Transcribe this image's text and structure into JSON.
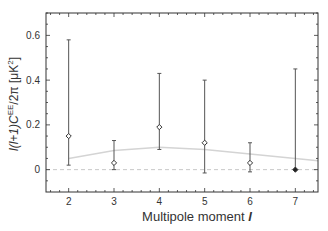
{
  "chart_data": {
    "type": "scatter",
    "title": "",
    "xlabel": "Multipole moment l",
    "ylabel": "l(l+1)C_l^EE/2π [μK²]",
    "xlim": [
      1.5,
      7.5
    ],
    "ylim": [
      -0.1,
      0.7
    ],
    "x_ticks": [
      2,
      3,
      4,
      5,
      6,
      7
    ],
    "y_ticks": [
      0,
      0.2,
      0.4,
      0.6
    ],
    "y_tick_labels": [
      "0",
      "0.2",
      "0.4",
      "0.6"
    ],
    "grid": false,
    "legend": null,
    "series": [
      {
        "name": "Measured C_l^EE",
        "marker": "open-diamond",
        "points": [
          {
            "l": 2,
            "value": 0.15,
            "err_low": 0.02,
            "err_high": 0.58
          },
          {
            "l": 3,
            "value": 0.03,
            "err_low": 0.0,
            "err_high": 0.13
          },
          {
            "l": 4,
            "value": 0.19,
            "err_low": 0.09,
            "err_high": 0.43
          },
          {
            "l": 5,
            "value": 0.12,
            "err_low": -0.015,
            "err_high": 0.4
          },
          {
            "l": 6,
            "value": 0.03,
            "err_low": -0.01,
            "err_high": 0.12
          },
          {
            "l": 7,
            "value": 0.0,
            "err_low": 0.0,
            "err_high": 0.45,
            "marker": "filled-diamond"
          }
        ]
      },
      {
        "name": "Model curve",
        "style": "solid-light-gray",
        "x": [
          2,
          3,
          4,
          5,
          6,
          7,
          7.5
        ],
        "y": [
          0.05,
          0.085,
          0.1,
          0.09,
          0.07,
          0.05,
          0.04
        ]
      },
      {
        "name": "Zero reference",
        "style": "dashed-light-gray",
        "x": [
          1.5,
          7.5
        ],
        "y": [
          0,
          0
        ]
      }
    ]
  },
  "labels": {
    "xlabel_text": "Multipole moment ",
    "xlabel_italic": "l",
    "ylabel_part1": "l(l+1)C",
    "ylabel_sup": "EE",
    "ylabel_sub": "l",
    "ylabel_part2": "/2π [μK",
    "ylabel_sup2": "2",
    "ylabel_part3": "]"
  }
}
